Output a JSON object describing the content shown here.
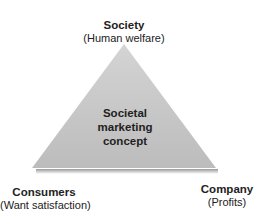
{
  "diagram": {
    "type": "triangle",
    "center_label": [
      "Societal",
      "marketing",
      "concept"
    ],
    "vertices": {
      "top": {
        "title": "Society",
        "subtitle": "(Human welfare)"
      },
      "bottom_left": {
        "title": "Consumers",
        "subtitle": "(Want satisfaction)"
      },
      "bottom_right": {
        "title": "Company",
        "subtitle": "(Profits)"
      }
    },
    "colors": {
      "fill_top": "#d2d2d2",
      "fill_bottom": "#bdbdbd",
      "text": "#222222"
    }
  }
}
